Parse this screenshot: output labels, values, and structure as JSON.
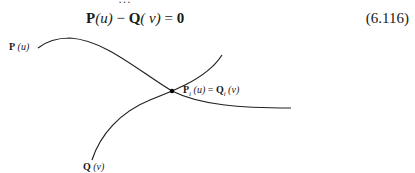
{
  "top_cutoff_text": "…",
  "equation": {
    "P": "P",
    "u_arg": "(u)",
    "minus": " − ",
    "Q": "Q",
    "v_arg": "( v)",
    "equals": " = ",
    "zero": "0",
    "number": "(6.116)"
  },
  "figure": {
    "curve_P_label": {
      "name": "P",
      "arg": "(u)"
    },
    "curve_Q_label": {
      "name": "Q",
      "arg": "(v)"
    },
    "intersection_label": {
      "P": "P",
      "P_sub": "i",
      "P_arg": " (u)",
      "equals": " = ",
      "Q": "Q",
      "Q_sub": "i",
      "Q_arg": " (v)"
    },
    "colors": {
      "curve": "#222222",
      "point": "#000000"
    }
  }
}
